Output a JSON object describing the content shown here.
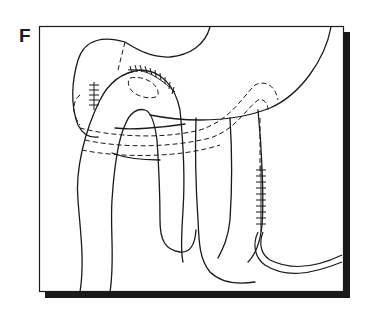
{
  "figure": {
    "panel_label": "F",
    "colors": {
      "line": "#1a1a1a",
      "background": "#ffffff",
      "shadow": "#1a1a1a"
    },
    "elements": [
      {
        "name": "stomach",
        "style": "solid outline"
      },
      {
        "name": "jejunal-loop",
        "style": "solid outline"
      },
      {
        "name": "hidden-bowel-path",
        "style": "dashed"
      },
      {
        "name": "suture-line-top",
        "style": "cross-hatched"
      },
      {
        "name": "suture-line-left",
        "style": "cross-hatched"
      },
      {
        "name": "suture-line-right",
        "style": "cross-hatched"
      },
      {
        "name": "drain-tube",
        "style": "double line"
      }
    ]
  }
}
